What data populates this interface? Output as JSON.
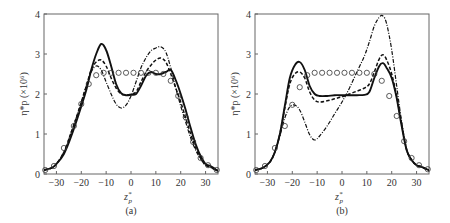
{
  "chart_data": [
    {
      "type": "line",
      "panel_label": "(a)",
      "xlabel": "z*p",
      "ylabel": "η*p (×10⁶)",
      "xlim": [
        -35,
        35
      ],
      "ylim": [
        0,
        4
      ],
      "xticks": [
        -30,
        -20,
        -10,
        0,
        10,
        20,
        30
      ],
      "yticks": [
        0,
        1,
        2,
        3,
        4
      ],
      "grid": false,
      "legend": null,
      "series": [
        {
          "name": "solid",
          "style": "solid",
          "points": [
            [
              -35,
              0.1
            ],
            [
              -32,
              0.15
            ],
            [
              -30,
              0.25
            ],
            [
              -27,
              0.5
            ],
            [
              -24,
              0.95
            ],
            [
              -21,
              1.5
            ],
            [
              -18,
              2.1
            ],
            [
              -16,
              2.6
            ],
            [
              -14,
              3.0
            ],
            [
              -12,
              3.25
            ],
            [
              -10,
              3.1
            ],
            [
              -8,
              2.7
            ],
            [
              -6,
              2.25
            ],
            [
              -4,
              2.02
            ],
            [
              -2,
              1.97
            ],
            [
              0,
              1.98
            ],
            [
              2,
              2.0
            ],
            [
              4,
              2.2
            ],
            [
              6,
              2.45
            ],
            [
              8,
              2.55
            ],
            [
              10,
              2.5
            ],
            [
              12,
              2.5
            ],
            [
              14,
              2.55
            ],
            [
              16,
              2.6
            ],
            [
              18,
              2.35
            ],
            [
              20,
              2.0
            ],
            [
              22,
              1.6
            ],
            [
              24,
              1.15
            ],
            [
              26,
              0.75
            ],
            [
              28,
              0.45
            ],
            [
              30,
              0.25
            ],
            [
              32,
              0.2
            ],
            [
              34,
              0.12
            ],
            [
              35,
              0.08
            ]
          ]
        },
        {
          "name": "dashed",
          "style": "dashed",
          "points": [
            [
              -35,
              0.1
            ],
            [
              -32,
              0.15
            ],
            [
              -30,
              0.25
            ],
            [
              -27,
              0.55
            ],
            [
              -24,
              1.05
            ],
            [
              -21,
              1.6
            ],
            [
              -18,
              2.2
            ],
            [
              -16,
              2.6
            ],
            [
              -14,
              2.8
            ],
            [
              -12,
              2.85
            ],
            [
              -10,
              2.7
            ],
            [
              -8,
              2.4
            ],
            [
              -6,
              2.15
            ],
            [
              -4,
              2.0
            ],
            [
              -2,
              1.98
            ],
            [
              0,
              2.0
            ],
            [
              2,
              2.05
            ],
            [
              4,
              2.3
            ],
            [
              6,
              2.55
            ],
            [
              8,
              2.72
            ],
            [
              10,
              2.85
            ],
            [
              12,
              2.9
            ],
            [
              14,
              2.8
            ],
            [
              16,
              2.5
            ],
            [
              18,
              2.15
            ],
            [
              20,
              1.8
            ],
            [
              22,
              1.4
            ],
            [
              24,
              1.0
            ],
            [
              26,
              0.65
            ],
            [
              28,
              0.4
            ],
            [
              30,
              0.22
            ],
            [
              32,
              0.17
            ],
            [
              34,
              0.1
            ],
            [
              35,
              0.08
            ]
          ]
        },
        {
          "name": "dash-dot",
          "style": "dashdot",
          "points": [
            [
              -35,
              0.1
            ],
            [
              -32,
              0.15
            ],
            [
              -30,
              0.25
            ],
            [
              -27,
              0.55
            ],
            [
              -24,
              1.05
            ],
            [
              -21,
              1.6
            ],
            [
              -18,
              2.2
            ],
            [
              -16,
              2.55
            ],
            [
              -14,
              2.7
            ],
            [
              -12,
              2.6
            ],
            [
              -10,
              2.3
            ],
            [
              -8,
              2.0
            ],
            [
              -6,
              1.75
            ],
            [
              -4,
              1.65
            ],
            [
              -2,
              1.72
            ],
            [
              0,
              1.95
            ],
            [
              2,
              2.3
            ],
            [
              4,
              2.65
            ],
            [
              6,
              2.9
            ],
            [
              8,
              3.08
            ],
            [
              10,
              3.15
            ],
            [
              12,
              3.18
            ],
            [
              14,
              3.05
            ],
            [
              16,
              2.65
            ],
            [
              18,
              2.15
            ],
            [
              20,
              1.7
            ],
            [
              22,
              1.3
            ],
            [
              24,
              0.9
            ],
            [
              26,
              0.6
            ],
            [
              28,
              0.38
            ],
            [
              30,
              0.22
            ],
            [
              32,
              0.17
            ],
            [
              34,
              0.1
            ],
            [
              35,
              0.08
            ]
          ]
        },
        {
          "name": "circles",
          "style": "markers",
          "points": [
            [
              -34.5,
              0.1
            ],
            [
              -31,
              0.2
            ],
            [
              -27,
              0.65
            ],
            [
              -23,
              1.2
            ],
            [
              -20,
              1.75
            ],
            [
              -17,
              2.25
            ],
            [
              -14,
              2.47
            ],
            [
              -11,
              2.53
            ],
            [
              -8,
              2.53
            ],
            [
              -5,
              2.53
            ],
            [
              -2,
              2.53
            ],
            [
              1,
              2.53
            ],
            [
              4,
              2.53
            ],
            [
              7,
              2.53
            ],
            [
              10,
              2.53
            ],
            [
              13,
              2.5
            ],
            [
              16,
              2.33
            ],
            [
              19,
              1.95
            ],
            [
              22,
              1.42
            ],
            [
              25,
              0.8
            ],
            [
              28,
              0.4
            ],
            [
              31,
              0.22
            ],
            [
              34.5,
              0.1
            ]
          ]
        }
      ]
    },
    {
      "type": "line",
      "panel_label": "(b)",
      "xlabel": "z*p",
      "ylabel": "η*p (×10⁶)",
      "xlim": [
        -35,
        35
      ],
      "ylim": [
        0,
        4
      ],
      "xticks": [
        -30,
        -20,
        -10,
        0,
        10,
        20,
        30
      ],
      "yticks": [
        0,
        1,
        2,
        3,
        4
      ],
      "grid": false,
      "legend": null,
      "series": [
        {
          "name": "solid",
          "style": "solid",
          "points": [
            [
              -35,
              0.1
            ],
            [
              -32,
              0.15
            ],
            [
              -29,
              0.3
            ],
            [
              -27,
              0.55
            ],
            [
              -25,
              1.0
            ],
            [
              -23,
              1.7
            ],
            [
              -21,
              2.4
            ],
            [
              -19,
              2.72
            ],
            [
              -17,
              2.8
            ],
            [
              -15,
              2.6
            ],
            [
              -13,
              2.2
            ],
            [
              -11,
              2.0
            ],
            [
              -9,
              1.95
            ],
            [
              -6,
              1.95
            ],
            [
              -3,
              1.97
            ],
            [
              0,
              1.97
            ],
            [
              3,
              1.97
            ],
            [
              6,
              1.97
            ],
            [
              9,
              1.98
            ],
            [
              11,
              2.05
            ],
            [
              13,
              2.4
            ],
            [
              15,
              2.7
            ],
            [
              16.5,
              2.77
            ],
            [
              18,
              2.65
            ],
            [
              20,
              2.4
            ],
            [
              22,
              1.9
            ],
            [
              24,
              1.2
            ],
            [
              26,
              0.6
            ],
            [
              28,
              0.35
            ],
            [
              30,
              0.22
            ],
            [
              32,
              0.18
            ],
            [
              34,
              0.12
            ],
            [
              35,
              0.1
            ]
          ]
        },
        {
          "name": "dashed",
          "style": "dashed",
          "points": [
            [
              -35,
              0.1
            ],
            [
              -32,
              0.15
            ],
            [
              -29,
              0.3
            ],
            [
              -27,
              0.55
            ],
            [
              -25,
              1.0
            ],
            [
              -23,
              1.65
            ],
            [
              -21,
              2.25
            ],
            [
              -19,
              2.5
            ],
            [
              -17,
              2.55
            ],
            [
              -15,
              2.4
            ],
            [
              -13,
              2.05
            ],
            [
              -11,
              1.85
            ],
            [
              -9,
              1.8
            ],
            [
              -6,
              1.83
            ],
            [
              -3,
              1.88
            ],
            [
              0,
              1.93
            ],
            [
              3,
              2.0
            ],
            [
              6,
              2.07
            ],
            [
              9,
              2.15
            ],
            [
              11,
              2.25
            ],
            [
              13,
              2.55
            ],
            [
              15,
              2.88
            ],
            [
              16.5,
              2.98
            ],
            [
              18,
              2.85
            ],
            [
              20,
              2.5
            ],
            [
              22,
              1.95
            ],
            [
              24,
              1.25
            ],
            [
              26,
              0.62
            ],
            [
              28,
              0.35
            ],
            [
              30,
              0.22
            ],
            [
              32,
              0.18
            ],
            [
              34,
              0.12
            ],
            [
              35,
              0.1
            ]
          ]
        },
        {
          "name": "dash-dot",
          "style": "dashdot",
          "points": [
            [
              -35,
              0.1
            ],
            [
              -32,
              0.15
            ],
            [
              -29,
              0.3
            ],
            [
              -27,
              0.55
            ],
            [
              -25,
              0.95
            ],
            [
              -23,
              1.4
            ],
            [
              -21,
              1.68
            ],
            [
              -19,
              1.72
            ],
            [
              -17,
              1.6
            ],
            [
              -15,
              1.3
            ],
            [
              -13,
              0.98
            ],
            [
              -11,
              0.85
            ],
            [
              -9,
              0.95
            ],
            [
              -6,
              1.2
            ],
            [
              -3,
              1.5
            ],
            [
              0,
              1.8
            ],
            [
              3,
              2.15
            ],
            [
              6,
              2.55
            ],
            [
              9,
              2.95
            ],
            [
              11,
              3.3
            ],
            [
              13,
              3.7
            ],
            [
              15,
              3.92
            ],
            [
              16.5,
              3.95
            ],
            [
              18,
              3.75
            ],
            [
              20,
              3.1
            ],
            [
              22,
              2.2
            ],
            [
              24,
              1.3
            ],
            [
              26,
              0.6
            ],
            [
              28,
              0.35
            ],
            [
              30,
              0.22
            ],
            [
              32,
              0.18
            ],
            [
              34,
              0.12
            ],
            [
              35,
              0.1
            ]
          ]
        },
        {
          "name": "circles",
          "style": "markers",
          "points": [
            [
              -34.5,
              0.1
            ],
            [
              -31,
              0.2
            ],
            [
              -27,
              0.65
            ],
            [
              -23,
              1.2
            ],
            [
              -20,
              1.73
            ],
            [
              -17,
              2.17
            ],
            [
              -14,
              2.47
            ],
            [
              -11,
              2.53
            ],
            [
              -8,
              2.53
            ],
            [
              -5,
              2.53
            ],
            [
              -2,
              2.53
            ],
            [
              1,
              2.53
            ],
            [
              4,
              2.53
            ],
            [
              7,
              2.53
            ],
            [
              10,
              2.53
            ],
            [
              13,
              2.5
            ],
            [
              16,
              2.33
            ],
            [
              19,
              1.95
            ],
            [
              22,
              1.45
            ],
            [
              25,
              0.82
            ],
            [
              28,
              0.4
            ],
            [
              31,
              0.22
            ],
            [
              34.5,
              0.12
            ]
          ]
        }
      ]
    }
  ],
  "panels": [
    {
      "label": "(a)",
      "xlabel": "z",
      "xlabel_sup": "*",
      "xlabel_sub": "p",
      "ylabel_text": "η*p (×10⁶)"
    },
    {
      "label": "(b)",
      "xlabel": "z",
      "xlabel_sup": "*",
      "xlabel_sub": "p",
      "ylabel_text": "η*p (×10⁶)"
    }
  ]
}
